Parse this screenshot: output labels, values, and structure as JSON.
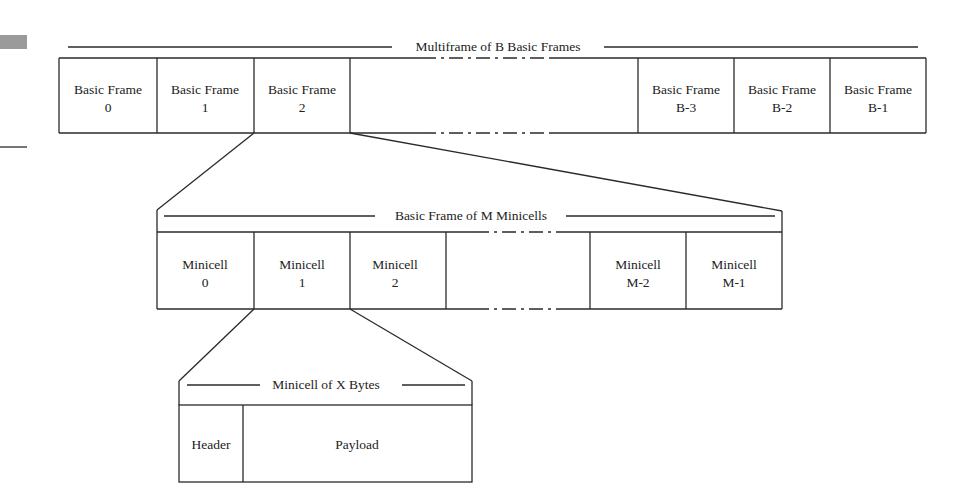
{
  "diagram": {
    "level1": {
      "title": "Multiframe of B Basic Frames",
      "cells": [
        {
          "line1": "Basic Frame",
          "line2": "0"
        },
        {
          "line1": "Basic Frame",
          "line2": "1"
        },
        {
          "line1": "Basic Frame",
          "line2": "2"
        },
        {
          "line1": "Basic Frame",
          "line2": "B-3"
        },
        {
          "line1": "Basic Frame",
          "line2": "B-2"
        },
        {
          "line1": "Basic Frame",
          "line2": "B-1"
        }
      ]
    },
    "level2": {
      "title": "Basic Frame of M Minicells",
      "cells": [
        {
          "line1": "Minicell",
          "line2": "0"
        },
        {
          "line1": "Minicell",
          "line2": "1"
        },
        {
          "line1": "Minicell",
          "line2": "2"
        },
        {
          "line1": "Minicell",
          "line2": "M-2"
        },
        {
          "line1": "Minicell",
          "line2": "M-1"
        }
      ]
    },
    "level3": {
      "title": "Minicell of X Bytes",
      "cells": [
        {
          "label": "Header"
        },
        {
          "label": "Payload"
        }
      ]
    },
    "colors": {
      "line": "#2a2a2a",
      "text": "#222222",
      "background": "#ffffff",
      "margin_mark": "#9a9a9a"
    }
  }
}
